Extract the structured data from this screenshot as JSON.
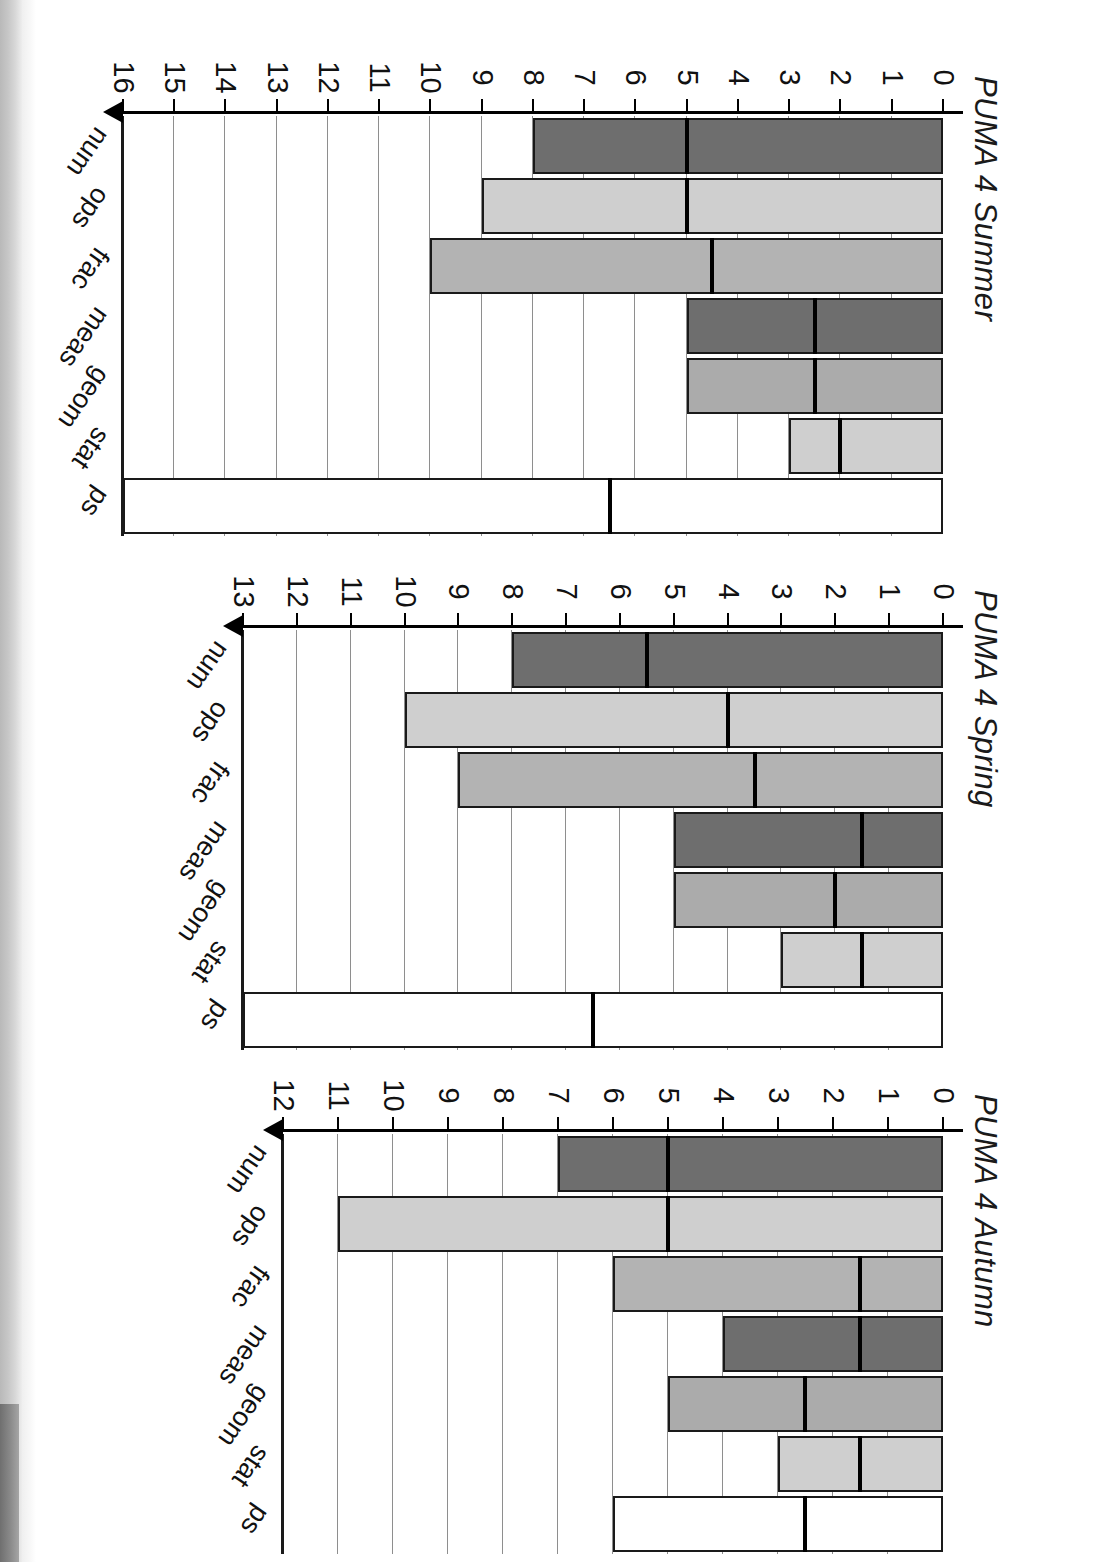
{
  "page": {
    "orientation": "rotated-180",
    "background": "#ffffff",
    "scan_edge_color": "#c6c6c6"
  },
  "palette": {
    "num": "#6e6e6e",
    "ops": "#cfcfcf",
    "frac": "#b3b3b3",
    "meas": "#6e6e6e",
    "geom": "#ababab",
    "stat": "#cfcfcf",
    "ps": "#ffffff",
    "outline": "#1a1a1a",
    "gridline": "#8e8e8e",
    "marker": "#000000"
  },
  "categories": [
    "num",
    "ops",
    "frac",
    "meas",
    "geom",
    "stat",
    "ps"
  ],
  "panels": [
    {
      "id": "summer",
      "title": "PUMA 4 Summer",
      "xlim": [
        0,
        16
      ],
      "ticks": [
        0,
        1,
        2,
        3,
        4,
        5,
        6,
        7,
        8,
        9,
        10,
        11,
        12,
        13,
        14,
        15,
        16
      ],
      "ticklabels": [
        "0",
        "1",
        "2",
        "3",
        "4",
        "5",
        "6",
        "7",
        "8",
        "9",
        "10",
        "11",
        "12",
        "13",
        "14",
        "15",
        "16"
      ],
      "values": [
        8,
        9,
        10,
        5,
        5,
        3,
        16
      ],
      "markers": [
        5,
        5,
        4.5,
        2.5,
        2.5,
        2,
        6.5
      ]
    },
    {
      "id": "spring",
      "title": "PUMA 4 Spring",
      "xlim": [
        0,
        13
      ],
      "ticks": [
        0,
        1,
        2,
        3,
        4,
        5,
        6,
        7,
        8,
        9,
        10,
        11,
        12,
        13
      ],
      "ticklabels": [
        "0",
        "1",
        "2",
        "3",
        "4",
        "5",
        "6",
        "7",
        "8",
        "9",
        "10",
        "11",
        "12",
        "13"
      ],
      "values": [
        8,
        10,
        9,
        5,
        5,
        3,
        13
      ],
      "markers": [
        5.5,
        4,
        3.5,
        1.5,
        2,
        1.5,
        6.5
      ]
    },
    {
      "id": "autumn",
      "title": "PUMA 4 Autumn",
      "xlim": [
        0,
        12
      ],
      "ticks": [
        0,
        1,
        2,
        3,
        4,
        5,
        6,
        7,
        8,
        9,
        10,
        11,
        12
      ],
      "ticklabels": [
        "0",
        "1",
        "2",
        "3",
        "4",
        "5",
        "6",
        "7",
        "8",
        "9",
        "10",
        "11",
        "12"
      ],
      "values": [
        7,
        11,
        6,
        4,
        5,
        3,
        6
      ],
      "markers": [
        5,
        5,
        1.5,
        1.5,
        2.5,
        1.5,
        2.5
      ]
    }
  ],
  "chart_data": {
    "type": "bar",
    "orientation": "horizontal",
    "grid": true,
    "legend": "none",
    "xlabel": "",
    "ylabel": "",
    "categories": [
      "num",
      "ops",
      "frac",
      "meas",
      "geom",
      "stat",
      "ps"
    ],
    "series": [
      {
        "name": "PUMA 4 Summer",
        "xlim": [
          0,
          16
        ],
        "values": [
          8,
          9,
          10,
          5,
          5,
          3,
          16
        ],
        "markers": [
          5,
          5,
          4.5,
          2.5,
          2.5,
          2,
          6.5
        ]
      },
      {
        "name": "PUMA 4 Spring",
        "xlim": [
          0,
          13
        ],
        "values": [
          8,
          10,
          9,
          5,
          5,
          3,
          13
        ],
        "markers": [
          5.5,
          4,
          3.5,
          1.5,
          2,
          1.5,
          6.5
        ]
      },
      {
        "name": "PUMA 4 Autumn",
        "xlim": [
          0,
          12
        ],
        "values": [
          7,
          11,
          6,
          4,
          5,
          3,
          6
        ],
        "markers": [
          5,
          5,
          1.5,
          1.5,
          2.5,
          1.5,
          2.5
        ]
      }
    ]
  }
}
